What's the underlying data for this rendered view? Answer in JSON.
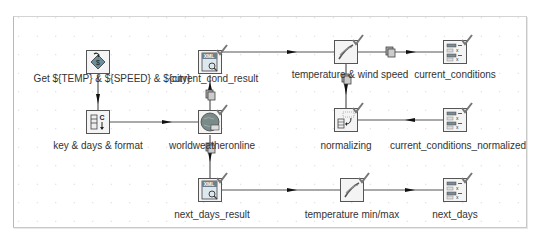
{
  "diagram": {
    "nodes": [
      {
        "id": "get_vars",
        "label": "Get ${TEMP} & ${SPEED} & ${city}",
        "icon": "javascript-icon",
        "x": 98,
        "y": 62,
        "validated": false
      },
      {
        "id": "key_days_format",
        "label": "key & days & format",
        "icon": "generate-rows-icon",
        "x": 98,
        "y": 122,
        "validated": false
      },
      {
        "id": "current_cond_result",
        "label": "current_cond_result",
        "icon": "xml-input-icon",
        "x": 210,
        "y": 62,
        "validated": true
      },
      {
        "id": "worldweatheronline",
        "label": "worldweatheronline",
        "icon": "http-client-icon",
        "x": 210,
        "y": 122,
        "validated": true
      },
      {
        "id": "next_days_result",
        "label": "next_days_result",
        "icon": "xml-input-icon",
        "x": 210,
        "y": 190,
        "validated": true
      },
      {
        "id": "temp_wind",
        "label": "temperature & wind speed",
        "icon": "calculator-icon",
        "x": 346,
        "y": 52,
        "validated": true
      },
      {
        "id": "normalizing",
        "label": "normalizing",
        "icon": "normaliser-icon",
        "x": 346,
        "y": 120,
        "validated": true
      },
      {
        "id": "temp_minmax",
        "label": "temperature min/max",
        "icon": "calculator-icon",
        "x": 352,
        "y": 190,
        "validated": true
      },
      {
        "id": "current_conditions",
        "label": "current_conditions",
        "icon": "select-values-icon",
        "x": 455,
        "y": 52,
        "validated": true
      },
      {
        "id": "current_conditions_normalized",
        "label": "current_conditions_normalized",
        "icon": "select-values-icon",
        "x": 455,
        "y": 120,
        "validated": true
      },
      {
        "id": "next_days",
        "label": "next_days",
        "icon": "select-values-icon",
        "x": 455,
        "y": 190,
        "validated": true
      }
    ],
    "hops": [
      {
        "from": "get_vars",
        "to": "key_days_format"
      },
      {
        "from": "key_days_format",
        "to": "worldweatheronline"
      },
      {
        "from": "worldweatheronline",
        "to": "current_cond_result",
        "copy": true
      },
      {
        "from": "worldweatheronline",
        "to": "next_days_result",
        "copy": true
      },
      {
        "from": "current_cond_result",
        "to": "temp_wind"
      },
      {
        "from": "temp_wind",
        "to": "current_conditions",
        "copy": true
      },
      {
        "from": "temp_wind",
        "to": "normalizing",
        "copy": true
      },
      {
        "from": "normalizing",
        "to": "current_conditions_normalized"
      },
      {
        "from": "next_days_result",
        "to": "temp_minmax"
      },
      {
        "from": "temp_minmax",
        "to": "next_days"
      }
    ]
  }
}
